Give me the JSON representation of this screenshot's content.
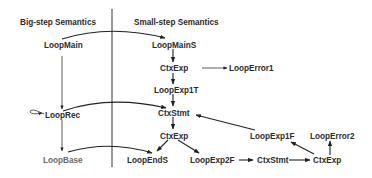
{
  "headers": {
    "left": "Big-step Semantics",
    "right": "Small-step Semantics"
  },
  "nodes": {
    "LoopMain": "LoopMain",
    "LoopRec": "LoopRec",
    "LoopBase": "LoopBase",
    "LoopMainS": "LoopMainS",
    "CtxExp1": "CtxExp",
    "LoopError1": "LoopError1",
    "LoopExp1T": "LoopExp1T",
    "CtxStmt1": "CtxStmt",
    "CtxExp2": "CtxExp",
    "LoopEndS": "LoopEndS",
    "LoopExp2F": "LoopExp2F",
    "CtxStmt2": "CtxStmt",
    "CtxExp3": "CtxExp",
    "LoopExp1F": "LoopExp1F",
    "LoopError2": "LoopError2"
  },
  "edges": [
    {
      "from": "LoopMain",
      "to": "LoopMainS",
      "style": "curved"
    },
    {
      "from": "LoopMain",
      "to": "LoopRec",
      "style": "straight"
    },
    {
      "from": "LoopRec",
      "to": "LoopRec",
      "style": "self-loop"
    },
    {
      "from": "LoopRec",
      "to": "CtxStmt1",
      "style": "curved"
    },
    {
      "from": "LoopRec",
      "to": "LoopBase",
      "style": "straight"
    },
    {
      "from": "LoopBase",
      "to": "LoopEndS",
      "style": "curved"
    },
    {
      "from": "LoopMainS",
      "to": "CtxExp1",
      "style": "straight"
    },
    {
      "from": "CtxExp1",
      "to": "LoopError1",
      "style": "straight"
    },
    {
      "from": "CtxExp1",
      "to": "LoopExp1T",
      "style": "straight"
    },
    {
      "from": "LoopExp1T",
      "to": "CtxStmt1",
      "style": "straight"
    },
    {
      "from": "CtxStmt1",
      "to": "CtxExp2",
      "style": "straight"
    },
    {
      "from": "CtxExp2",
      "to": "LoopEndS",
      "style": "straight"
    },
    {
      "from": "CtxExp2",
      "to": "LoopExp2F",
      "style": "straight"
    },
    {
      "from": "LoopExp2F",
      "to": "CtxStmt2",
      "style": "straight"
    },
    {
      "from": "CtxStmt2",
      "to": "CtxExp3",
      "style": "straight"
    },
    {
      "from": "CtxExp3",
      "to": "LoopExp1F",
      "style": "straight"
    },
    {
      "from": "CtxExp3",
      "to": "LoopError2",
      "style": "straight"
    },
    {
      "from": "LoopExp1F",
      "to": "CtxStmt1",
      "style": "straight"
    }
  ],
  "colors": {
    "text": "#2a2a2a",
    "text_light": "#6a6a6a",
    "edge": "#222222",
    "background": "#ffffff"
  }
}
